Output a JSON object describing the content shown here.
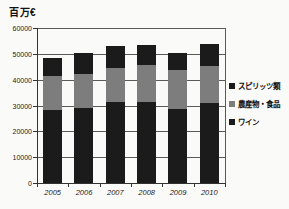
{
  "title": "百万€",
  "chart_data": {
    "type": "bar",
    "stacked": true,
    "title": "百万€",
    "title_note": "million euros",
    "categories": [
      "2005",
      "2006",
      "2007",
      "2008",
      "2009",
      "2010"
    ],
    "series": [
      {
        "name": "ワイン",
        "color": "#1b1b1b",
        "values": [
          28300,
          29000,
          31200,
          31500,
          28800,
          31000
        ]
      },
      {
        "name": "農産物・食品",
        "color": "#7d7d7d",
        "values": [
          13100,
          13300,
          13300,
          14000,
          14900,
          14200
        ]
      },
      {
        "name": "スピリッツ類",
        "color": "#1b1b1b",
        "values": [
          7100,
          8000,
          8500,
          7800,
          6800,
          8800
        ]
      }
    ],
    "totals": [
      48500,
      50300,
      53000,
      53300,
      50500,
      54000
    ],
    "ylim": [
      0,
      60000
    ],
    "y_ticks": [
      0,
      10000,
      20000,
      30000,
      40000,
      50000,
      60000
    ],
    "y_tick_labels": [
      "0",
      "10000",
      "20000",
      "30000",
      "40000",
      "50000",
      "60000"
    ],
    "grid": true,
    "legend_position": "right",
    "legend": [
      {
        "label": "スピリッツ類",
        "color": "#1b1b1b"
      },
      {
        "label": "農産物・食品",
        "color": "#7d7d7d"
      },
      {
        "label": "ワイン",
        "color": "#1b1b1b"
      }
    ]
  }
}
